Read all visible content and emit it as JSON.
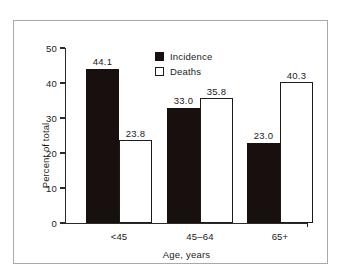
{
  "chart_data": {
    "type": "bar",
    "title": "",
    "subtitle": "",
    "xlabel": "Age, years",
    "ylabel": "Percent of total",
    "categories": [
      "<45",
      "45–64",
      "65+"
    ],
    "series": [
      {
        "name": "Incidence",
        "color": "#17100f",
        "values": [
          44.1,
          33.0,
          23.0
        ],
        "labels": [
          "44.1",
          "33.0",
          "23.0"
        ]
      },
      {
        "name": "Deaths",
        "color": "#ffffff",
        "values": [
          23.8,
          35.8,
          40.3
        ],
        "labels": [
          "23.8",
          "35.8",
          "40.3"
        ]
      }
    ],
    "ylim": [
      0,
      50
    ],
    "ytick_values": [
      0,
      10,
      20,
      30,
      40,
      50
    ],
    "ytick_labels": [
      "0",
      "10",
      "20",
      "30",
      "40",
      "50"
    ],
    "grid": false,
    "legend_position": "top-center",
    "legend_entries": [
      "Incidence",
      "Deaths"
    ]
  },
  "figure": {
    "frame_color": "#a9a9a9",
    "background_color": "#ffffff",
    "axis_color": "#2b2b2b",
    "text_color": "#1b1b1b"
  }
}
